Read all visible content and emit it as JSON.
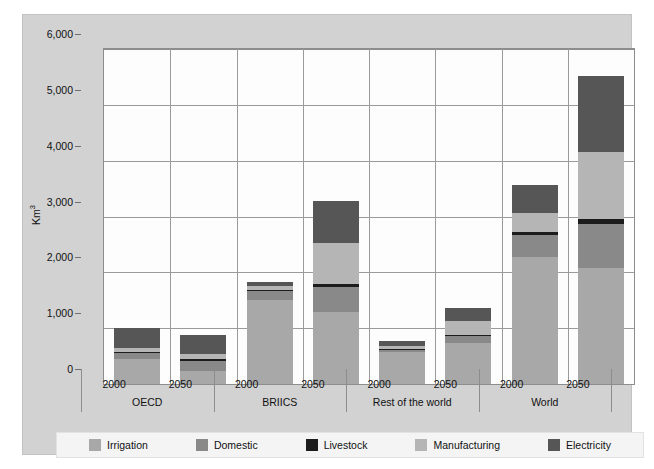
{
  "chart_data": {
    "type": "bar",
    "subtype": "stacked-bar-grouped",
    "title": "",
    "xlabel": "",
    "ylabel": "Km3",
    "ylabel_display": "Km",
    "ylabel_superscript": "3",
    "ylim": [
      0,
      6000
    ],
    "ytick_step": 1000,
    "ytick_labels": [
      "6,000",
      "5,000",
      "4,000",
      "3,000",
      "2,000",
      "1,000",
      "0"
    ],
    "ytick_values": [
      6000,
      5000,
      4000,
      3000,
      2000,
      1000,
      0
    ],
    "grid": "horizontal-and-vertical",
    "legend_position": "bottom",
    "groups": [
      "OECD",
      "BRIICS",
      "Rest of the world",
      "World"
    ],
    "years": [
      "2000",
      "2050"
    ],
    "categories": [
      "OECD 2000",
      "OECD 2050",
      "BRIICS 2000",
      "BRIICS 2050",
      "Rest of the world 2000",
      "Rest of the world 2050",
      "World 2000",
      "World 2050"
    ],
    "series": [
      {
        "name": "Irrigation",
        "color": "#a8a8a8",
        "values": [
          440,
          230,
          1500,
          1290,
          570,
          730,
          2280,
          2070
        ]
      },
      {
        "name": "Domestic",
        "color": "#898989",
        "values": [
          120,
          190,
          160,
          450,
          50,
          130,
          390,
          800
        ]
      },
      {
        "name": "Livestock",
        "color": "#1c1c1c",
        "values": [
          15,
          20,
          30,
          50,
          15,
          25,
          60,
          90
        ]
      },
      {
        "name": "Manufacturing",
        "color": "#b5b5b5",
        "values": [
          75,
          90,
          60,
          730,
          50,
          250,
          330,
          1200
        ]
      },
      {
        "name": "Electricity",
        "color": "#565656",
        "values": [
          350,
          350,
          80,
          750,
          85,
          225,
          510,
          1350
        ]
      }
    ],
    "totals": [
      1000,
      880,
      1830,
      3270,
      770,
      1360,
      3570,
      5510
    ]
  },
  "legend": {
    "items": [
      {
        "label": "Irrigation",
        "color": "#a8a8a8"
      },
      {
        "label": "Domestic",
        "color": "#898989"
      },
      {
        "label": "Livestock",
        "color": "#1c1c1c"
      },
      {
        "label": "Manufacturing",
        "color": "#b5b5b5"
      },
      {
        "label": "Electricity",
        "color": "#565656"
      }
    ]
  },
  "axis": {
    "y_title": "Km",
    "y_title_sup": "3",
    "y_labels": [
      "6,000",
      "5,000",
      "4,000",
      "3,000",
      "2,000",
      "1,000",
      "0"
    ]
  },
  "xaxis": {
    "years": [
      "2000",
      "2050",
      "2000",
      "2050",
      "2000",
      "2050",
      "2000",
      "2050"
    ],
    "groups": [
      "OECD",
      "BRIICS",
      "Rest of the world",
      "World"
    ]
  },
  "colors": {
    "panel_background": "#d2d2d2",
    "plot_background": "#fdfdfd",
    "gridline": "#9a9a9a",
    "axis_line": "#8d8d8d",
    "text": "#111111",
    "legend_background": "#f4f4f4"
  }
}
